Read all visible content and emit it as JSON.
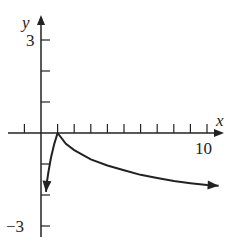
{
  "chart_data": {
    "type": "line",
    "title": "",
    "xlabel": "x",
    "ylabel": "y",
    "xlim": [
      -1,
      10.8
    ],
    "ylim": [
      -3.3,
      3.4
    ],
    "x_ticks": [
      -1,
      1,
      2,
      3,
      4,
      5,
      6,
      7,
      8,
      9,
      10
    ],
    "x_tick_labels": {
      "10": "10"
    },
    "y_ticks": [
      3,
      2,
      1,
      -1,
      -2,
      -3
    ],
    "y_tick_labels": {
      "3": "3",
      "-3": "−3"
    },
    "grid": false,
    "series": [
      {
        "name": "left-branch",
        "x": [
          1,
          0.8,
          0.6,
          0.45,
          0.35,
          0.3
        ],
        "y": [
          0,
          -0.35,
          -0.8,
          -1.25,
          -1.6,
          -1.9
        ],
        "arrow_end": true
      },
      {
        "name": "right-branch",
        "x": [
          1,
          1.5,
          2,
          3,
          4,
          5,
          6,
          7,
          8,
          9,
          10,
          10.7
        ],
        "y": [
          0,
          -0.35,
          -0.55,
          -0.85,
          -1.05,
          -1.2,
          -1.35,
          -1.45,
          -1.55,
          -1.62,
          -1.68,
          -1.7
        ],
        "arrow_end": true
      }
    ],
    "annotations": [
      "cusp at (1, 0)"
    ]
  },
  "labels": {
    "x_axis": "x",
    "y_axis": "y",
    "y_top": "3",
    "y_bottom": "−3",
    "x_right": "10"
  }
}
